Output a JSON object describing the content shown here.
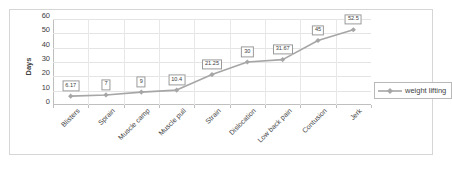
{
  "chart_data": {
    "type": "line",
    "title": "",
    "xlabel": "",
    "ylabel": "Days",
    "categories": [
      "Blisters",
      "Sprain",
      "Muscle camp",
      "Muscle pull",
      "Strain",
      "Dislocation",
      "Low back pain",
      "Contusion",
      "Jerk"
    ],
    "values": [
      6.17,
      7,
      9,
      10.4,
      21.25,
      30,
      31.67,
      45,
      52.5
    ],
    "data_labels": [
      "6.17",
      "7",
      "9",
      "10.4",
      "21.25",
      "30",
      "31.67",
      "45",
      "52.5"
    ],
    "series": [
      {
        "name": "weight lifting",
        "values": [
          6.17,
          7,
          9,
          10.4,
          21.25,
          30,
          31.67,
          45,
          52.5
        ]
      }
    ],
    "ylim": [
      0,
      60
    ],
    "yticks": [
      0,
      10,
      20,
      30,
      40,
      50,
      60
    ],
    "ytick_labels": [
      "0",
      "10",
      "20",
      "30",
      "40",
      "50",
      "60"
    ],
    "grid": true,
    "legend_position": "right",
    "colors": {
      "series_line": "#a6a6a6",
      "marker": "#a6a6a6",
      "grid": "#e4e4e4",
      "axis": "#bfbfbf",
      "label_border": "#9a9a9a",
      "text": "#3f3f3f",
      "plot_background": "#ffffff"
    }
  },
  "legend": {
    "entries": [
      {
        "label": "weight lifting",
        "marker": "diamond-line-marker"
      }
    ]
  }
}
